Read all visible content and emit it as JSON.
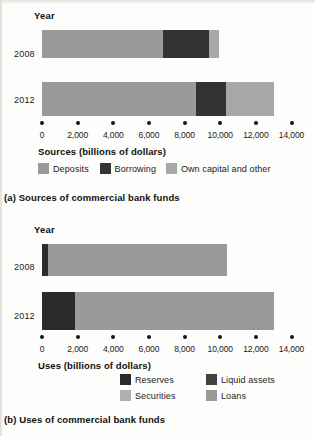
{
  "chart_data": [
    {
      "type": "bar",
      "orientation": "horizontal",
      "stacked": true,
      "title": "(a) Sources of commercial bank funds",
      "axis_group_label": "Year",
      "categories": [
        "2008",
        "2012"
      ],
      "xlabel": "Sources (billions of dollars)",
      "ylabel": "Year",
      "xlim": [
        0,
        14000
      ],
      "xticks": [
        0,
        2000,
        4000,
        6000,
        8000,
        10000,
        12000,
        14000
      ],
      "xticklabels": [
        "0",
        "2,000",
        "4,000",
        "6,000",
        "8,000",
        "10,000",
        "12,000",
        "14,000"
      ],
      "grid": false,
      "legend_position": "below-axis",
      "series": [
        {
          "name": "Deposits",
          "color": "#9a9a9a",
          "values": [
            6800,
            8630
          ]
        },
        {
          "name": "Borrowing",
          "color": "#3a3a3a",
          "values": [
            2580,
            1680
          ]
        },
        {
          "name": "Own capital and other",
          "color": "#a8a8a8",
          "values": [
            560,
            2690
          ]
        }
      ],
      "totals": [
        9940,
        13000
      ]
    },
    {
      "type": "bar",
      "orientation": "horizontal",
      "stacked": true,
      "title": "(b) Uses of commercial bank funds",
      "axis_group_label": "Year",
      "categories": [
        "2008",
        "2012"
      ],
      "xlabel": "Uses (billions of dollars)",
      "ylabel": "Year",
      "xlim": [
        0,
        14000
      ],
      "xticks": [
        0,
        2000,
        4000,
        6000,
        8000,
        10000,
        12000,
        14000
      ],
      "xticklabels": [
        "0",
        "2,000",
        "4,000",
        "6,000",
        "8,000",
        "10,000",
        "12,000",
        "14,000"
      ],
      "grid": false,
      "legend_position": "below-axis",
      "series": [
        {
          "name": "Reserves",
          "color": "#2b2b2b",
          "values": [
            350,
            1850
          ]
        },
        {
          "name": "Liquid assets",
          "color": "#414141",
          "values": [
            0,
            0
          ]
        },
        {
          "name": "Securities",
          "color": "#b0b0b0",
          "values": [
            0,
            0
          ]
        },
        {
          "name": "Loans",
          "color": "#9a9a9a",
          "values": [
            10050,
            11150
          ]
        }
      ],
      "totals": [
        10400,
        13000
      ]
    }
  ],
  "panel_a": {
    "year_header": "Year",
    "category_labels": [
      "2008",
      "2012"
    ],
    "axis_title": "Sources (billions of dollars)",
    "tick_labels": [
      "0",
      "2,000",
      "4,000",
      "6,000",
      "8,000",
      "10,000",
      "12,000",
      "14,000"
    ],
    "legend": [
      {
        "label": "Deposits",
        "color": "#9a9a9a"
      },
      {
        "label": "Borrowing",
        "color": "#333333"
      },
      {
        "label": "Own capital and other",
        "color": "#a8a8a8"
      }
    ],
    "caption": "(a) Sources of commercial bank funds"
  },
  "panel_b": {
    "year_header": "Year",
    "category_labels": [
      "2008",
      "2012"
    ],
    "axis_title": "Uses (billions of dollars)",
    "tick_labels": [
      "0",
      "2,000",
      "4,000",
      "6,000",
      "8,000",
      "10,000",
      "12,000",
      "14,000"
    ],
    "legend": [
      {
        "label": "Reserves",
        "color": "#2b2b2b"
      },
      {
        "label": "Liquid assets",
        "color": "#414141"
      },
      {
        "label": "Securities",
        "color": "#b0b0b0"
      },
      {
        "label": "Loans",
        "color": "#9a9a9a"
      }
    ],
    "caption": "(b) Uses of commercial bank funds"
  },
  "colors": {
    "background": "#fdfdfb",
    "text": "#1a1a1a",
    "axis_dot": "#141414",
    "deposits": "#9a9a9a",
    "borrowing": "#333333",
    "own_capital": "#a8a8a8",
    "reserves": "#2b2b2b",
    "liquid_assets": "#414141",
    "securities": "#b0b0b0",
    "loans": "#9a9a9a"
  }
}
